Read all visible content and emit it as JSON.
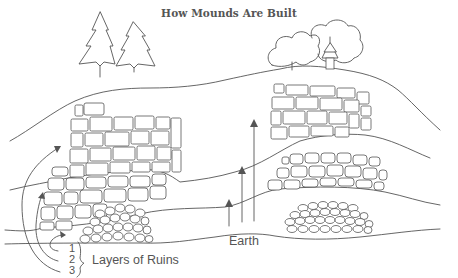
{
  "title": "How Mounds Are Built",
  "labels": {
    "layers": "Layers of Ruins",
    "layer_numbers": [
      "1",
      "2",
      "3"
    ],
    "earth": "Earth"
  },
  "colors": {
    "ink": "#555555",
    "background": "#ffffff"
  },
  "layers": [
    {
      "id": 1,
      "description": "bottom ruin layer - rubble foundations (oldest)"
    },
    {
      "id": 2,
      "description": "middle ruin layer - stone walls"
    },
    {
      "id": 3,
      "description": "top ruin layer - tall stone walls (youngest), with trees and shrine on top"
    }
  ],
  "decorations": {
    "left_hilltop": "two pine trees",
    "right_hilltop": "deciduous trees and small shrine"
  }
}
